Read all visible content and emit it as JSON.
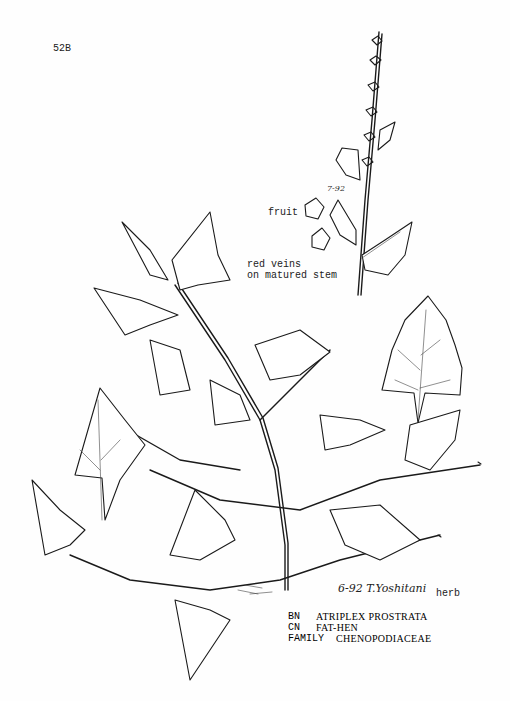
{
  "page": {
    "plate_id": "52B",
    "background": "#fefefe",
    "ink_color": "#1a1a1a"
  },
  "annotations": {
    "date_on_stem": "7-92",
    "fruit_label": "fruit",
    "stem_note_line1": "red veins",
    "stem_note_line2": "on matured stem",
    "signature": "6-92 T.Yoshitani",
    "habit_label": "herb"
  },
  "specimen_label": {
    "rows": [
      {
        "key": "BN",
        "value": "ATRIPLEX PROSTRATA"
      },
      {
        "key": "CN",
        "value": "FAT-HEN"
      },
      {
        "key": "FAMILY",
        "value": "CHENOPODIACEAE"
      }
    ]
  },
  "illustration": {
    "subject": "Atriplex prostrata plant line drawing",
    "parts": [
      "flowering-spike",
      "fruit-bracts",
      "single-leaf",
      "main-herb"
    ]
  }
}
